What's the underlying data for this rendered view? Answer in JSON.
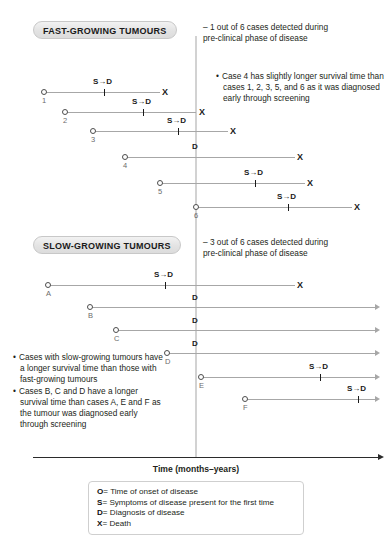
{
  "sections": [
    {
      "id": "fast",
      "badge": "FAST-GROWING TUMOURS",
      "note": "– 1 out of 6 cases detected during\n   pre-clinical phase of disease",
      "bullet": "Case 4 has slightly longer survival time than cases 1, 2, 3, 5, and 6 as it was diagnosed early through screening",
      "cases": [
        {
          "label": "1",
          "onset": "O",
          "mark": "S→D",
          "end": "X"
        },
        {
          "label": "2",
          "onset": "O",
          "mark": "S→D",
          "end": "X"
        },
        {
          "label": "3",
          "onset": "O",
          "mark": "S→D",
          "end": "X"
        },
        {
          "label": "4",
          "onset": "O",
          "mark": "D",
          "end": "X"
        },
        {
          "label": "5",
          "onset": "O",
          "mark": "S→D",
          "end": "X"
        },
        {
          "label": "6",
          "onset": "O",
          "mark": "S→D",
          "end": "X"
        }
      ]
    },
    {
      "id": "slow",
      "badge": "SLOW-GROWING TUMOURS",
      "note": "– 3 out of 6 cases detected during\n   pre-clinical phase of disease",
      "bullets": [
        "Cases with slow-growing tumours have a longer survival time than those with fast-growing tumours",
        "Cases B, C and D have a longer survival time than cases A, E and F as the tumour was diagnosed early through screening"
      ],
      "cases": [
        {
          "label": "A",
          "onset": "O",
          "mark": "S→D",
          "end": "X"
        },
        {
          "label": "B",
          "onset": "O",
          "mark": "D",
          "end": "arrow"
        },
        {
          "label": "C",
          "onset": "O",
          "mark": "D",
          "end": "arrow"
        },
        {
          "label": "D",
          "onset": "O",
          "mark": "D",
          "end": "arrow"
        },
        {
          "label": "E",
          "onset": "O",
          "mark": "S→D",
          "end": "arrow"
        },
        {
          "label": "F",
          "onset": "O",
          "mark": "S→D",
          "end": "arrow"
        }
      ]
    }
  ],
  "axis": {
    "label": "Time (months–years)"
  },
  "legend": [
    {
      "symbol": "O",
      "eq": "=",
      "text": "Time of onset of disease"
    },
    {
      "symbol": "S",
      "eq": "=",
      "text": "Symptoms of disease present for the first time"
    },
    {
      "symbol": "D",
      "eq": "=",
      "text": "Diagnosis of disease"
    },
    {
      "symbol": "X",
      "eq": "=",
      "text": "Death"
    }
  ],
  "colors": {
    "timeline": "#a7a7a7",
    "screening_line": "#d2d2d2",
    "axis": "#2b2b2b",
    "text": "#231f20",
    "badge_bg": "#e3e3e3"
  }
}
